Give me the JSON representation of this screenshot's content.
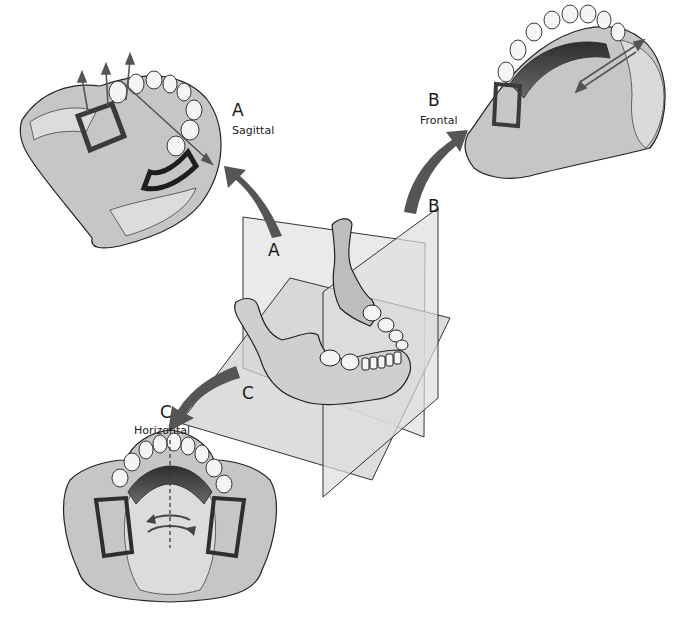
{
  "diagram": {
    "colors": {
      "background": "#ffffff",
      "cast_fill": "#c9c9c9",
      "cast_light": "#dcdcdc",
      "plane_fill": "#e9e9e9",
      "plane_dark": "#b8b8b8",
      "framework": "#4a4a4a",
      "arrow": "#555555",
      "tooth": "#f4f4f4",
      "outline": "#222222"
    },
    "views": [
      {
        "id": "A",
        "letter": "A",
        "name": "Sagittal"
      },
      {
        "id": "B",
        "letter": "B",
        "name": "Frontal"
      },
      {
        "id": "C",
        "letter": "C",
        "name": "Horizontal"
      }
    ],
    "plane_labels": [
      {
        "id": "A",
        "letter": "A"
      },
      {
        "id": "B",
        "letter": "B"
      },
      {
        "id": "C",
        "letter": "C"
      }
    ]
  }
}
